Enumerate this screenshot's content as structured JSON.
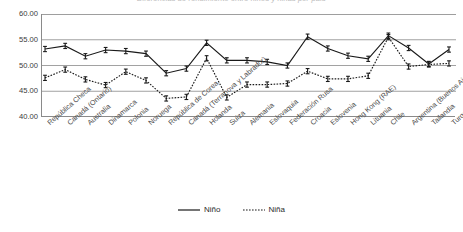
{
  "chart_title": "Diferencias de rendimiento entre niños y niñas por país",
  "legend": {
    "position": "bottom-center",
    "entries": [
      {
        "name": "Niño",
        "style": "solid",
        "icon": "solid-line-icon",
        "color": "#1a1a1a"
      },
      {
        "name": "Niña",
        "style": "dotted",
        "icon": "dotted-line-icon",
        "color": "#1a1a1a"
      }
    ]
  },
  "chart_data": {
    "type": "line",
    "title": "Diferencias de rendimiento entre niños y niñas por país",
    "xlabel": "",
    "ylabel": "",
    "ylim": [
      40.0,
      60.0
    ],
    "yticks": [
      "40.00",
      "45.00",
      "50.00",
      "55.00",
      "60.00"
    ],
    "ytick_values": [
      40.0,
      45.0,
      50.0,
      55.0,
      60.0
    ],
    "grid": true,
    "error_bars": true,
    "categories": [
      "República Checa",
      "Canadá (Ontario)",
      "Australia",
      "Dinamarca",
      "Polonia",
      "Noruega",
      "República de Corea",
      "Canadá (Terranova y Labrador)",
      "Holanda",
      "Suiza",
      "Alemania",
      "Eslovaquia",
      "Federación Rusa",
      "Croacia",
      "Eslovenia",
      "Hong Kong (RAE)",
      "Lituania",
      "Chile",
      "Argentina (Buenos Aires)",
      "Tailandia",
      "Turquía"
    ],
    "series": [
      {
        "name": "Niño",
        "style": "solid",
        "color": "#1a1a1a",
        "values": [
          53.2,
          53.8,
          51.8,
          53.0,
          52.8,
          52.3,
          48.5,
          49.4,
          54.4,
          51.0,
          51.0,
          50.7,
          50.0,
          55.6,
          53.3,
          51.9,
          51.3,
          55.8,
          53.4,
          50.3,
          53.1
        ]
      },
      {
        "name": "Niña",
        "style": "dotted",
        "color": "#1a1a1a",
        "values": [
          47.6,
          49.2,
          47.3,
          46.2,
          48.8,
          47.1,
          43.6,
          43.9,
          51.4,
          43.8,
          46.3,
          46.3,
          46.5,
          48.9,
          47.4,
          47.4,
          48.0,
          55.5,
          49.8,
          50.2,
          50.4
        ]
      }
    ]
  }
}
